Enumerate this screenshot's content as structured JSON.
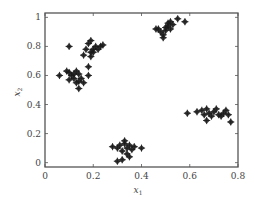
{
  "chart_data": {
    "type": "scatter",
    "title": "",
    "xlabel": "x1",
    "ylabel": "x2",
    "xlim": [
      0.0,
      0.8
    ],
    "ylim": [
      -0.03,
      1.03
    ],
    "xticks": [
      0,
      0.2,
      0.4,
      0.6,
      0.8
    ],
    "xtick_labels": [
      "0",
      "0.2",
      "0.4",
      "0.6",
      "0.8"
    ],
    "yticks": [
      0,
      0.2,
      0.4,
      0.6,
      0.8,
      1
    ],
    "ytick_labels": [
      "0",
      "0.2",
      "0.4",
      "0.6",
      "0.8",
      "1"
    ],
    "grid": false,
    "legend": null,
    "marker": "diamond-plus",
    "marker_color": "#1a1a1a",
    "series": [
      {
        "name": "cluster-upper-left",
        "points": [
          [
            0.1,
            0.8
          ],
          [
            0.17,
            0.78
          ],
          [
            0.18,
            0.82
          ],
          [
            0.19,
            0.84
          ],
          [
            0.2,
            0.78
          ],
          [
            0.2,
            0.76
          ],
          [
            0.21,
            0.8
          ],
          [
            0.23,
            0.8
          ],
          [
            0.16,
            0.74
          ],
          [
            0.19,
            0.73
          ],
          [
            0.22,
            0.78
          ],
          [
            0.24,
            0.81
          ],
          [
            0.19,
            0.76
          ]
        ]
      },
      {
        "name": "cluster-left",
        "points": [
          [
            0.06,
            0.6
          ],
          [
            0.09,
            0.63
          ],
          [
            0.1,
            0.62
          ],
          [
            0.11,
            0.6
          ],
          [
            0.12,
            0.61
          ],
          [
            0.13,
            0.63
          ],
          [
            0.14,
            0.61
          ],
          [
            0.1,
            0.57
          ],
          [
            0.12,
            0.58
          ],
          [
            0.14,
            0.56
          ],
          [
            0.13,
            0.55
          ],
          [
            0.15,
            0.58
          ],
          [
            0.16,
            0.55
          ],
          [
            0.14,
            0.51
          ],
          [
            0.18,
            0.66
          ],
          [
            0.18,
            0.6
          ]
        ]
      },
      {
        "name": "cluster-top-center",
        "points": [
          [
            0.46,
            0.92
          ],
          [
            0.47,
            0.92
          ],
          [
            0.48,
            0.9
          ],
          [
            0.49,
            0.88
          ],
          [
            0.5,
            0.91
          ],
          [
            0.5,
            0.93
          ],
          [
            0.51,
            0.94
          ],
          [
            0.51,
            0.96
          ],
          [
            0.52,
            0.92
          ],
          [
            0.52,
            0.97
          ],
          [
            0.53,
            0.95
          ],
          [
            0.49,
            0.86
          ],
          [
            0.55,
            0.99
          ],
          [
            0.58,
            0.97
          ]
        ]
      },
      {
        "name": "cluster-right",
        "points": [
          [
            0.59,
            0.34
          ],
          [
            0.63,
            0.35
          ],
          [
            0.65,
            0.36
          ],
          [
            0.66,
            0.33
          ],
          [
            0.67,
            0.37
          ],
          [
            0.68,
            0.34
          ],
          [
            0.69,
            0.32
          ],
          [
            0.7,
            0.35
          ],
          [
            0.71,
            0.37
          ],
          [
            0.72,
            0.33
          ],
          [
            0.73,
            0.32
          ],
          [
            0.74,
            0.34
          ],
          [
            0.75,
            0.36
          ],
          [
            0.76,
            0.33
          ],
          [
            0.67,
            0.29
          ],
          [
            0.77,
            0.28
          ]
        ]
      },
      {
        "name": "cluster-bottom-center",
        "points": [
          [
            0.28,
            0.11
          ],
          [
            0.3,
            0.1
          ],
          [
            0.31,
            0.12
          ],
          [
            0.32,
            0.08
          ],
          [
            0.33,
            0.13
          ],
          [
            0.33,
            0.15
          ],
          [
            0.34,
            0.1
          ],
          [
            0.34,
            0.06
          ],
          [
            0.35,
            0.12
          ],
          [
            0.35,
            0.04
          ],
          [
            0.36,
            0.09
          ],
          [
            0.37,
            0.11
          ],
          [
            0.3,
            0.01
          ],
          [
            0.32,
            0.02
          ],
          [
            0.4,
            0.1
          ]
        ]
      }
    ]
  },
  "axes": {
    "x_label_main": "x",
    "x_label_sub": "1",
    "y_label_main": "x",
    "y_label_sub": "2"
  }
}
